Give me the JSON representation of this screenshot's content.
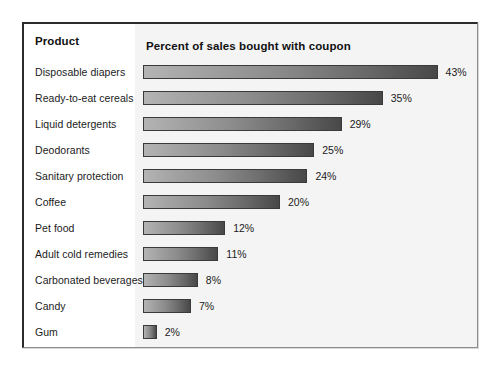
{
  "panel": {
    "header_product": "Product",
    "header_metric": "Percent of sales bought with coupon"
  },
  "chart_data": {
    "type": "bar",
    "orientation": "horizontal",
    "title": "Percent of sales bought with coupon",
    "xlabel": "Percent of sales bought with coupon",
    "ylabel": "Product",
    "grid": false,
    "legend": "none",
    "xlim": [
      0,
      43
    ],
    "value_suffix": "%",
    "px_per_percent": 6.85,
    "colors": {
      "bar_gradient_start": "#b4b4b4",
      "bar_gradient_end": "#484848",
      "bar_border": "#3a3a3a",
      "panel_border": "#2b2b2b",
      "plot_background": "#f4f4f4",
      "text": "#1b1b1b"
    },
    "categories": [
      "Disposable diapers",
      "Ready-to-eat cereals",
      "Liquid detergents",
      "Deodorants",
      "Sanitary protection",
      "Coffee",
      "Pet food",
      "Adult cold remedies",
      "Carbonated beverages",
      "Candy",
      "Gum"
    ],
    "values": [
      43,
      35,
      29,
      25,
      24,
      20,
      12,
      11,
      8,
      7,
      2
    ],
    "value_labels": [
      "43%",
      "35%",
      "29%",
      "25%",
      "24%",
      "20%",
      "12%",
      "11%",
      "8%",
      "7%",
      "2%"
    ]
  }
}
